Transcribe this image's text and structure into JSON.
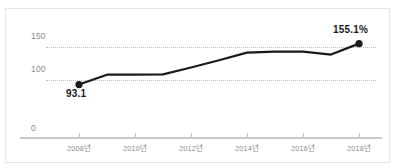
{
  "figure": {
    "background_color": "#ffffff",
    "frame_color": "#e3e3e3",
    "artifact_text": "",
    "line_color": "#1a1a1a",
    "grid_color": "#bdbdbd",
    "axis_color": "#c9c9c9",
    "tick_label_color": "#8e8e8e"
  },
  "chart_data": {
    "type": "line",
    "title": "",
    "subtitle": "",
    "xlabel": "",
    "ylabel": "",
    "grid": true,
    "legend": false,
    "ylim": [
      0,
      170
    ],
    "yticks": [
      0,
      100,
      150
    ],
    "ytick_labels": [
      "0",
      "100",
      "150"
    ],
    "xticks": [
      "2008년",
      "2010년",
      "2012년",
      "2014년",
      "2016년",
      "2018년"
    ],
    "x": [
      2008,
      2009,
      2010,
      2011,
      2012,
      2013,
      2014,
      2015,
      2016,
      2017,
      2018
    ],
    "series": [
      {
        "name": "",
        "values": [
          93.1,
          108.0,
          108.2,
          108.5,
          119.0,
          130.0,
          141.5,
          143.0,
          143.0,
          138.5,
          155.1
        ]
      }
    ],
    "annotations": [
      {
        "x": 2008,
        "y": 93.1,
        "text": "93.1",
        "position": "below"
      },
      {
        "x": 2018,
        "y": 155.1,
        "text": "155.1%",
        "position": "above"
      }
    ],
    "markers": [
      {
        "x": 2008,
        "y": 93.1
      },
      {
        "x": 2018,
        "y": 155.1
      }
    ]
  },
  "axis": {
    "y": {
      "label_150": "150",
      "label_100": "100",
      "label_0": "0"
    },
    "x": {
      "tick_2008": "2008년",
      "tick_2010": "2010년",
      "tick_2012": "2012년",
      "tick_2014": "2014년",
      "tick_2016": "2016년",
      "tick_2018": "2018년"
    }
  },
  "labels": {
    "start_value": "93.1",
    "end_value": "155.1%"
  }
}
